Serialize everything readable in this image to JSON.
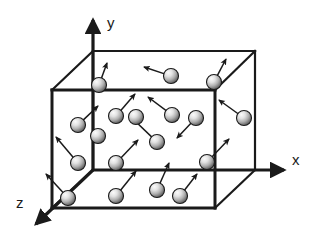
{
  "figure": {
    "background_color": "#ffffff",
    "line_color": "#1a1a1a",
    "width": 316,
    "height": 238
  },
  "axes": {
    "origin": {
      "x": 93,
      "y": 170
    },
    "items": [
      {
        "name": "y-axis",
        "label": "y",
        "label_pos": {
          "x": 107,
          "y": 28
        },
        "tip": {
          "x": 93,
          "y": 20
        },
        "stroke_width": 3.2
      },
      {
        "name": "x-axis",
        "label": "x",
        "label_pos": {
          "x": 292,
          "y": 165
        },
        "tip": {
          "x": 284,
          "y": 170
        },
        "stroke_width": 3.2
      },
      {
        "name": "z-axis",
        "label": "z",
        "label_pos": {
          "x": 16,
          "y": 208
        },
        "tip": {
          "x": 36,
          "y": 224
        },
        "stroke_width": 3.2
      }
    ]
  },
  "box": {
    "name": "container-box",
    "stroke_color": "#1a1a1a",
    "front_face": {
      "left": 52,
      "right": 215,
      "top": 90,
      "bottom": 208
    },
    "back_face": {
      "left": 93,
      "right": 255,
      "top": 51,
      "bottom": 170
    },
    "edge_width_front": 3.0,
    "edge_width_back": 2.2
  },
  "particles": {
    "color_highlight": "#f2f2f2",
    "color_mid": "#b8b8b8",
    "color_shadow": "#4d4d4d",
    "outline_color": "#1a1a1a",
    "radius": 7.5,
    "count": 18,
    "arrow_color": "#1a1a1a",
    "items": [
      {
        "id": 1,
        "cx": 99,
        "cy": 85,
        "r": 7.5,
        "vx": 8,
        "vy": -22
      },
      {
        "id": 2,
        "cx": 171,
        "cy": 76,
        "r": 7.5,
        "vx": -27,
        "vy": -9
      },
      {
        "id": 3,
        "cx": 214,
        "cy": 82,
        "r": 7.5,
        "vx": 12,
        "vy": -23
      },
      {
        "id": 4,
        "cx": 78,
        "cy": 125,
        "r": 7.5,
        "vx": 20,
        "vy": -19
      },
      {
        "id": 5,
        "cx": 116,
        "cy": 116,
        "r": 7.5,
        "vx": 19,
        "vy": -22
      },
      {
        "id": 6,
        "cx": 172,
        "cy": 115,
        "r": 7.5,
        "vx": -24,
        "vy": -18
      },
      {
        "id": 7,
        "cx": 196,
        "cy": 118,
        "r": 7.5,
        "vx": -19,
        "vy": 20
      },
      {
        "id": 8,
        "cx": 244,
        "cy": 118,
        "r": 7.5,
        "vx": -25,
        "vy": -18
      },
      {
        "id": 9,
        "cx": 157,
        "cy": 142,
        "r": 7.5,
        "vx": -24,
        "vy": -23
      },
      {
        "id": 10,
        "cx": 78,
        "cy": 163,
        "r": 7.5,
        "vx": -22,
        "vy": -26
      },
      {
        "id": 11,
        "cx": 116,
        "cy": 163,
        "r": 7.5,
        "vx": 22,
        "vy": -23
      },
      {
        "id": 12,
        "cx": 68,
        "cy": 198,
        "r": 7.5,
        "vx": -22,
        "vy": -24
      },
      {
        "id": 13,
        "cx": 116,
        "cy": 196,
        "r": 7.5,
        "vx": 20,
        "vy": -25
      },
      {
        "id": 14,
        "cx": 157,
        "cy": 190,
        "r": 7.5,
        "vx": 12,
        "vy": -27
      },
      {
        "id": 15,
        "cx": 180,
        "cy": 196,
        "r": 7.5,
        "vx": 17,
        "vy": -22
      },
      {
        "id": 16,
        "cx": 207,
        "cy": 162,
        "r": 7.5,
        "vx": 22,
        "vy": -23
      },
      {
        "id": 17,
        "cx": 136,
        "cy": 117,
        "r": 7.5,
        "vx": 0,
        "vy": 0
      },
      {
        "id": 18,
        "cx": 98,
        "cy": 136,
        "r": 7.5,
        "vx": 0,
        "vy": 0
      }
    ]
  }
}
